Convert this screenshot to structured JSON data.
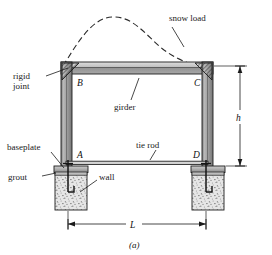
{
  "figure": {
    "caption": "(a)",
    "labels": {
      "snow_load": "snow load",
      "rigid_joint_line1": "rigid",
      "rigid_joint_line2": "joint",
      "girder": "girder",
      "baseplate": "baseplate",
      "grout": "grout",
      "wall": "wall",
      "tie_rod": "tie rod"
    },
    "nodes": {
      "b": "B",
      "c": "C",
      "a": "A",
      "d": "D"
    },
    "dimensions": {
      "span": "L",
      "height": "h"
    },
    "colors": {
      "line": "#1a1a1a",
      "member_light": "#d8d8d8",
      "member_mid": "#a9a9a9",
      "member_dark": "#6e6e6e",
      "concrete_fill": "#e2e2e2",
      "speckle": "#6a6a6a",
      "background": "#ffffff"
    }
  }
}
